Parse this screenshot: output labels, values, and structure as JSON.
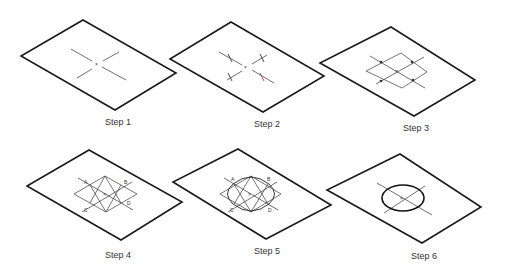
{
  "diagram": {
    "title": "",
    "steps": [
      {
        "id": 1,
        "label": "Step 1",
        "content": "Isometric plane with center point and two isometric center lines"
      },
      {
        "id": 2,
        "label": "Step 2",
        "content": "Radius marks laid off along each center line"
      },
      {
        "id": 3,
        "label": "Step 3",
        "content": "Isometric square (rhombus) drawn through the radius marks"
      },
      {
        "id": 4,
        "label": "Step 4",
        "content": "Perpendicular bisectors drawn from obtuse corners; points A, B, C, D labelled",
        "points": [
          "A",
          "B",
          "C",
          "D"
        ]
      },
      {
        "id": 5,
        "label": "Step 5",
        "content": "Arcs swung from intersection centers to form the ellipse",
        "points": [
          "A",
          "B",
          "C",
          "D"
        ]
      },
      {
        "id": 6,
        "label": "Step 6",
        "content": "Completed isometric ellipse with center lines"
      }
    ],
    "colors": {
      "stroke": "#1a1a1a",
      "background": "#ffffff",
      "accent_mark": "#a04050"
    }
  }
}
